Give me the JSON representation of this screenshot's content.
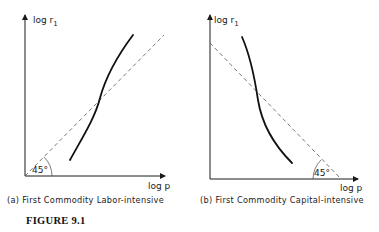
{
  "figure": {
    "title": "FIGURE 9.1",
    "panels": [
      {
        "id": "a",
        "caption": "(a) First Commodity Labor-intensive",
        "y_label": "log r",
        "y_label_sub": "1",
        "x_label": "log p",
        "angle_label": "45°",
        "reference_line": "45-degree dashed line rising from origin",
        "curve": "upward-sloping solid curve crossing the 45° line"
      },
      {
        "id": "b",
        "caption": "(b) First Commodity Capital-intensive",
        "y_label": "log r",
        "y_label_sub": "1",
        "x_label": "log p",
        "angle_label": "45°",
        "reference_line": "dashed line falling at 45° to the x-axis",
        "curve": "downward-sloping solid curve crossing the dashed line"
      }
    ]
  },
  "colors": {
    "ink": "#111111",
    "dashed": "#555555",
    "background": "#ffffff"
  }
}
